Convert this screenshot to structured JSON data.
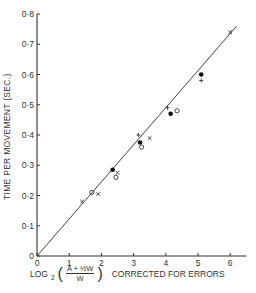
{
  "chart_data": {
    "type": "scatter",
    "title": "",
    "xlabel": "LOG2 ((A + 1/2 W) / W) CORRECTED FOR ERRORS",
    "xlabel_parts": {
      "log": "LOG",
      "sub": "2",
      "numerator": "A + ½W",
      "denominator": "W",
      "suffix": "CORRECTED FOR ERRORS"
    },
    "ylabel": "TIME PER MOVEMENT (SEC.)",
    "xlim": [
      0,
      6.5
    ],
    "ylim": [
      0,
      0.8
    ],
    "x_ticks": [
      "0",
      "1",
      "2",
      "3",
      "4",
      "5",
      "6"
    ],
    "y_ticks": [
      "0",
      "0·1",
      "0·2",
      "0·3",
      "0·4",
      "0·5",
      "0·6",
      "0·7",
      "0·8"
    ],
    "grid": false,
    "legend": null,
    "series": [
      {
        "name": "filled-circle",
        "marker": "filled-circle",
        "points": [
          [
            2.35,
            0.285
          ],
          [
            3.2,
            0.375
          ],
          [
            4.15,
            0.47
          ],
          [
            5.1,
            0.6
          ]
        ]
      },
      {
        "name": "open-circle",
        "marker": "open-circle",
        "points": [
          [
            1.7,
            0.21
          ],
          [
            2.45,
            0.26
          ],
          [
            3.25,
            0.36
          ],
          [
            4.35,
            0.48
          ]
        ]
      },
      {
        "name": "cross",
        "marker": "x",
        "points": [
          [
            1.4,
            0.18
          ],
          [
            1.9,
            0.205
          ],
          [
            2.5,
            0.275
          ],
          [
            3.5,
            0.39
          ],
          [
            6.0,
            0.74
          ]
        ]
      },
      {
        "name": "plus",
        "marker": "+",
        "points": [
          [
            3.15,
            0.4
          ],
          [
            4.05,
            0.49
          ],
          [
            5.1,
            0.58
          ]
        ]
      }
    ],
    "fit_line": {
      "from": [
        0,
        0
      ],
      "to": [
        6.2,
        0.76
      ]
    }
  }
}
